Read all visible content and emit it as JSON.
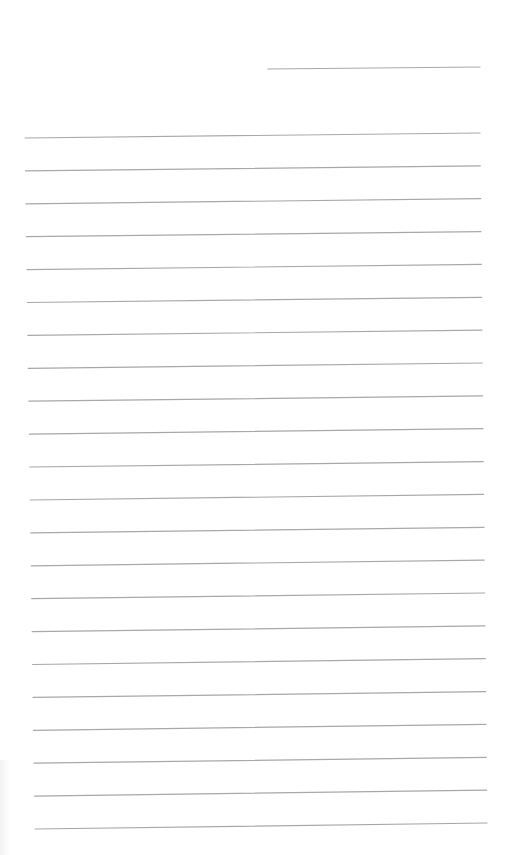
{
  "document": {
    "type": "lined-writing-sheet",
    "line_color": "#a8a8a8",
    "background": "#ffffff",
    "header_line": {
      "x1": 268,
      "y1": 69,
      "x2": 480,
      "y2": 67
    },
    "rule_count": 22,
    "rule_start": {
      "left_x": 25,
      "left_y": 138,
      "right_x": 480,
      "right_y": 133
    },
    "rule_end": {
      "left_x": 35,
      "left_y": 829,
      "right_x": 487,
      "right_y": 823
    },
    "rule_spacing_px": 32.9
  }
}
